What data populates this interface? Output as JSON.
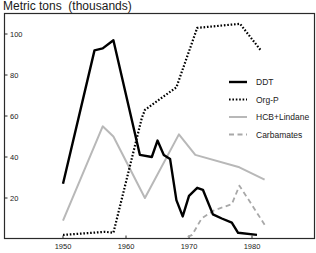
{
  "chart_data": {
    "type": "line",
    "title": "",
    "ylabel": "Metric tons  (thousands)",
    "xlabel": "",
    "xlim": [
      1948,
      1988
    ],
    "ylim": [
      0,
      108
    ],
    "grid": false,
    "legend_position": "right-center",
    "x_ticks": [
      1950,
      1960,
      1970,
      1980
    ],
    "y_ticks": [
      20,
      40,
      60,
      80,
      100
    ],
    "series": [
      {
        "name": "DDT",
        "style": "solid-black-thick",
        "color": "#000000",
        "points": [
          [
            1950,
            27
          ],
          [
            1955,
            92
          ],
          [
            1956.3,
            93
          ],
          [
            1958,
            97
          ],
          [
            1962.2,
            41
          ],
          [
            1964.1,
            40
          ],
          [
            1965,
            48
          ],
          [
            1966,
            41
          ],
          [
            1967,
            39
          ],
          [
            1968,
            19
          ],
          [
            1969,
            11
          ],
          [
            1970,
            21
          ],
          [
            1971.3,
            25
          ],
          [
            1972.2,
            24
          ],
          [
            1973.8,
            12
          ],
          [
            1975.2,
            10
          ],
          [
            1976.8,
            8
          ],
          [
            1977.8,
            3
          ],
          [
            1980.8,
            2
          ]
        ]
      },
      {
        "name": "Org-P",
        "style": "dotted-black",
        "color": "#000000",
        "points": [
          [
            1950,
            2
          ],
          [
            1956.7,
            3.5
          ],
          [
            1958,
            3
          ],
          [
            1962.5,
            59
          ],
          [
            1963,
            63
          ],
          [
            1968,
            74
          ],
          [
            1971.3,
            103
          ],
          [
            1978.1,
            105
          ],
          [
            1981.4,
            92
          ]
        ]
      },
      {
        "name": "HCB+Lindane",
        "style": "solid-light-gray",
        "color": "#b5b5b5",
        "points": [
          [
            1950,
            9
          ],
          [
            1956.3,
            55
          ],
          [
            1958,
            50
          ],
          [
            1963,
            20
          ],
          [
            1968.4,
            51
          ],
          [
            1971,
            41
          ],
          [
            1978,
            35
          ],
          [
            1982,
            29
          ]
        ]
      },
      {
        "name": "Carbamates",
        "style": "dashed-gray",
        "color": "#a8a8a8",
        "points": [
          [
            1969.8,
            1
          ],
          [
            1970.5,
            2
          ],
          [
            1972,
            10
          ],
          [
            1974,
            14
          ],
          [
            1976.8,
            17
          ],
          [
            1978,
            26
          ],
          [
            1979.5,
            19
          ],
          [
            1982,
            7
          ]
        ]
      }
    ]
  }
}
